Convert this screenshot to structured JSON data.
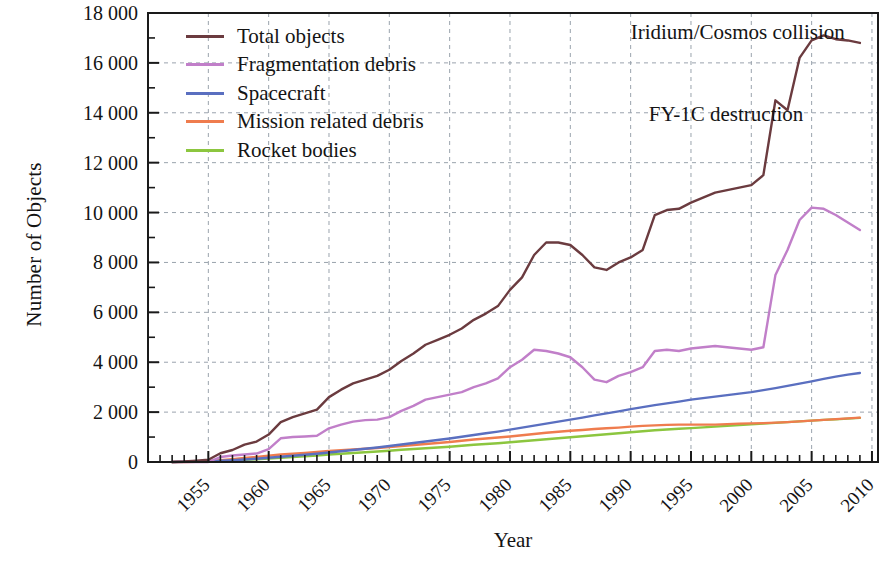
{
  "chart_data": {
    "type": "line",
    "title": "",
    "xlabel": "Year",
    "ylabel": "Number of Objects",
    "xlim": [
      1955,
      2015.5
    ],
    "ylim": [
      0,
      18000
    ],
    "xticks": [
      "1955",
      "1960",
      "1965",
      "1970",
      "1975",
      "1980",
      "1985",
      "1990",
      "1995",
      "2000",
      "2005",
      "2010",
      "2015"
    ],
    "xtick_values": [
      1955,
      1960,
      1965,
      1970,
      1975,
      1980,
      1985,
      1990,
      1995,
      2000,
      2005,
      2010,
      2015
    ],
    "yticks": [
      "0",
      "2 000",
      "4 000",
      "6 000",
      "8 000",
      "10 000",
      "12 000",
      "14 000",
      "16 000",
      "18 000"
    ],
    "ytick_values": [
      0,
      2000,
      4000,
      6000,
      8000,
      10000,
      12000,
      14000,
      16000,
      18000
    ],
    "grid": true,
    "grid_style": "dashed",
    "legend_position": "upper-left",
    "x": [
      1957,
      1958,
      1959,
      1960,
      1961,
      1962,
      1963,
      1964,
      1965,
      1966,
      1967,
      1968,
      1969,
      1970,
      1971,
      1972,
      1973,
      1974,
      1975,
      1976,
      1977,
      1978,
      1979,
      1980,
      1981,
      1982,
      1983,
      1984,
      1985,
      1986,
      1987,
      1988,
      1989,
      1990,
      1991,
      1992,
      1993,
      1994,
      1995,
      1996,
      1997,
      1998,
      1999,
      2000,
      2001,
      2002,
      2003,
      2004,
      2005,
      2006,
      2007,
      2008,
      2009,
      2010,
      2011,
      2012,
      2013,
      2014
    ],
    "series": [
      {
        "name": "Total objects",
        "color": "#6b3b3f",
        "values": [
          2,
          20,
          50,
          90,
          350,
          480,
          700,
          820,
          1100,
          1600,
          1800,
          1950,
          2100,
          2600,
          2900,
          3150,
          3300,
          3450,
          3700,
          4050,
          4350,
          4700,
          4900,
          5100,
          5350,
          5700,
          5950,
          6250,
          6900,
          7400,
          8300,
          8800,
          8800,
          8700,
          8300,
          7800,
          7700,
          8000,
          8200,
          8500,
          9900,
          10100,
          10150,
          10400,
          10600,
          10800,
          10900,
          11000,
          11100,
          11500,
          14500,
          14100,
          16200,
          16900,
          17100,
          16950,
          16900,
          16800
        ]
      },
      {
        "name": "Fragmentation debris",
        "color": "#c17fc9",
        "values": [
          0,
          0,
          0,
          0,
          200,
          260,
          300,
          340,
          520,
          950,
          1000,
          1020,
          1050,
          1350,
          1500,
          1620,
          1680,
          1700,
          1800,
          2050,
          2250,
          2500,
          2600,
          2700,
          2800,
          3000,
          3150,
          3350,
          3800,
          4100,
          4500,
          4450,
          4350,
          4200,
          3800,
          3300,
          3200,
          3450,
          3600,
          3800,
          4450,
          4500,
          4450,
          4550,
          4600,
          4650,
          4600,
          4550,
          4500,
          4600,
          7500,
          8500,
          9700,
          10200,
          10150,
          9900,
          9600,
          9300
        ]
      },
      {
        "name": "Spacecraft",
        "color": "#5a6fc0",
        "values": [
          1,
          10,
          20,
          30,
          50,
          70,
          100,
          130,
          170,
          210,
          250,
          290,
          330,
          380,
          430,
          480,
          530,
          580,
          640,
          700,
          760,
          820,
          880,
          940,
          1010,
          1080,
          1150,
          1220,
          1300,
          1380,
          1460,
          1540,
          1620,
          1700,
          1780,
          1870,
          1950,
          2030,
          2120,
          2200,
          2280,
          2350,
          2420,
          2500,
          2560,
          2620,
          2680,
          2740,
          2800,
          2880,
          2960,
          3050,
          3140,
          3230,
          3330,
          3420,
          3500,
          3570
        ]
      },
      {
        "name": "Mission related debris",
        "color": "#ef7c4e",
        "values": [
          0,
          2,
          10,
          20,
          70,
          110,
          160,
          200,
          250,
          300,
          330,
          360,
          400,
          440,
          470,
          500,
          530,
          560,
          600,
          640,
          680,
          720,
          760,
          800,
          850,
          900,
          940,
          980,
          1020,
          1070,
          1120,
          1170,
          1210,
          1250,
          1280,
          1320,
          1350,
          1380,
          1420,
          1450,
          1470,
          1490,
          1500,
          1500,
          1500,
          1500,
          1520,
          1540,
          1550,
          1560,
          1580,
          1600,
          1630,
          1660,
          1690,
          1720,
          1750,
          1780
        ]
      },
      {
        "name": "Rocket bodies",
        "color": "#8cc63f",
        "values": [
          1,
          5,
          12,
          22,
          40,
          60,
          85,
          110,
          140,
          170,
          200,
          230,
          260,
          300,
          330,
          360,
          390,
          420,
          450,
          490,
          520,
          550,
          580,
          610,
          650,
          690,
          720,
          750,
          790,
          830,
          870,
          910,
          950,
          990,
          1030,
          1070,
          1110,
          1150,
          1190,
          1230,
          1270,
          1300,
          1330,
          1360,
          1390,
          1420,
          1450,
          1480,
          1510,
          1540,
          1570,
          1600,
          1630,
          1660,
          1690,
          1710,
          1740,
          1770
        ]
      }
    ],
    "annotations": [
      {
        "text": "Iridium/Cosmos collision",
        "x": 1995.0,
        "y": 17200
      },
      {
        "text": "FY-1C destruction",
        "x": 1996.5,
        "y": 13900
      }
    ]
  },
  "legend": {
    "items": [
      {
        "label": "Total objects",
        "color": "#6b3b3f"
      },
      {
        "label": "Fragmentation debris",
        "color": "#c17fc9"
      },
      {
        "label": "Spacecraft",
        "color": "#5a6fc0"
      },
      {
        "label": "Mission related debris",
        "color": "#ef7c4e"
      },
      {
        "label": "Rocket bodies",
        "color": "#8cc63f"
      }
    ]
  }
}
